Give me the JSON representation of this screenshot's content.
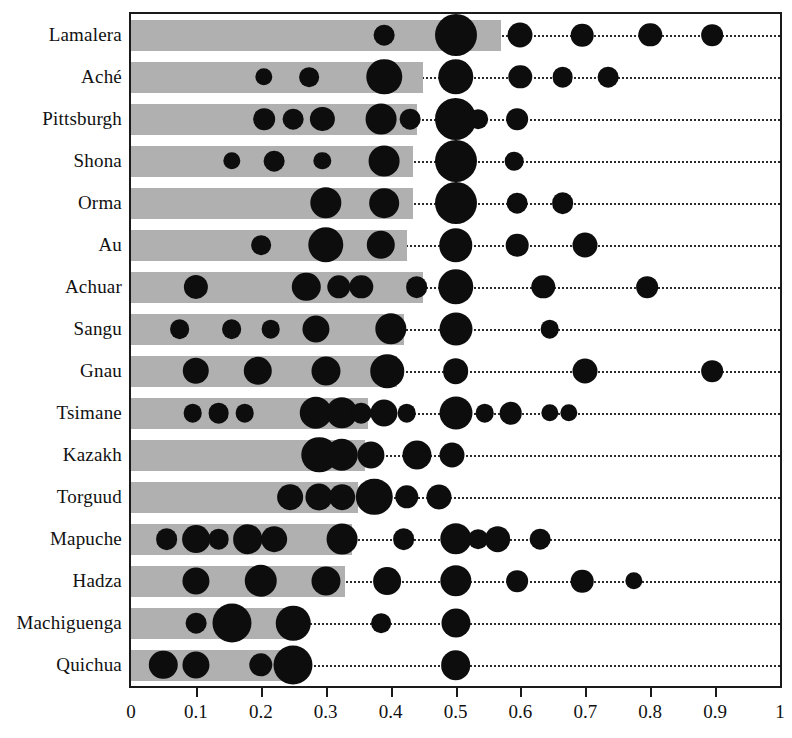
{
  "chart_data": {
    "type": "bar",
    "title": "",
    "xlabel": "",
    "ylabel": "",
    "xlim": [
      0,
      1
    ],
    "ylim": null,
    "grid": false,
    "legend": null,
    "xticks": [
      "0",
      "0.1",
      "0.2",
      "0.3",
      "0.4",
      "0.5",
      "0.6",
      "0.7",
      "0.8",
      "0.9",
      "1"
    ],
    "xtick_values": [
      0,
      0.1,
      0.2,
      0.3,
      0.4,
      0.5,
      0.6,
      0.7,
      0.8,
      0.9,
      1.0
    ],
    "categories": [
      "Lamalera",
      "Aché",
      "Pittsburgh",
      "Shona",
      "Orma",
      "Au",
      "Achuar",
      "Sangu",
      "Gnau",
      "Tsimane",
      "Kazakh",
      "Torguud",
      "Mapuche",
      "Hadza",
      "Machiguenga",
      "Quichua"
    ],
    "values": [
      0.57,
      0.45,
      0.44,
      0.435,
      0.435,
      0.425,
      0.45,
      0.42,
      0.41,
      0.365,
      0.36,
      0.35,
      0.34,
      0.33,
      0.26,
      0.25
    ],
    "series": [
      {
        "name": "Lamalera",
        "mean": 0.57,
        "mode_points": [
          {
            "x": 0.39,
            "weight": 0.07
          },
          {
            "x": 0.5,
            "weight": 0.63
          },
          {
            "x": 0.6,
            "weight": 0.12
          },
          {
            "x": 0.695,
            "weight": 0.09
          },
          {
            "x": 0.8,
            "weight": 0.1
          },
          {
            "x": 0.895,
            "weight": 0.08
          }
        ]
      },
      {
        "name": "Aché",
        "mean": 0.45,
        "mode_points": [
          {
            "x": 0.205,
            "weight": 0.04
          },
          {
            "x": 0.275,
            "weight": 0.06
          },
          {
            "x": 0.39,
            "weight": 0.3
          },
          {
            "x": 0.5,
            "weight": 0.3
          },
          {
            "x": 0.6,
            "weight": 0.1
          },
          {
            "x": 0.665,
            "weight": 0.07
          },
          {
            "x": 0.735,
            "weight": 0.07
          }
        ]
      },
      {
        "name": "Pittsburgh",
        "mean": 0.44,
        "mode_points": [
          {
            "x": 0.205,
            "weight": 0.08
          },
          {
            "x": 0.25,
            "weight": 0.07
          },
          {
            "x": 0.295,
            "weight": 0.11
          },
          {
            "x": 0.385,
            "weight": 0.21
          },
          {
            "x": 0.43,
            "weight": 0.07
          },
          {
            "x": 0.5,
            "weight": 0.45
          },
          {
            "x": 0.535,
            "weight": 0.06
          },
          {
            "x": 0.595,
            "weight": 0.08
          }
        ]
      },
      {
        "name": "Shona",
        "mean": 0.435,
        "mode_points": [
          {
            "x": 0.155,
            "weight": 0.04
          },
          {
            "x": 0.22,
            "weight": 0.07
          },
          {
            "x": 0.295,
            "weight": 0.04
          },
          {
            "x": 0.39,
            "weight": 0.21
          },
          {
            "x": 0.5,
            "weight": 0.48
          },
          {
            "x": 0.59,
            "weight": 0.05
          }
        ]
      },
      {
        "name": "Orma",
        "mean": 0.435,
        "mode_points": [
          {
            "x": 0.3,
            "weight": 0.22
          },
          {
            "x": 0.39,
            "weight": 0.19
          },
          {
            "x": 0.5,
            "weight": 0.48
          },
          {
            "x": 0.595,
            "weight": 0.07
          },
          {
            "x": 0.665,
            "weight": 0.08
          }
        ]
      },
      {
        "name": "Au",
        "mean": 0.425,
        "mode_points": [
          {
            "x": 0.2,
            "weight": 0.06
          },
          {
            "x": 0.3,
            "weight": 0.3
          },
          {
            "x": 0.385,
            "weight": 0.17
          },
          {
            "x": 0.5,
            "weight": 0.26
          },
          {
            "x": 0.595,
            "weight": 0.09
          },
          {
            "x": 0.7,
            "weight": 0.12
          }
        ]
      },
      {
        "name": "Achuar",
        "mean": 0.45,
        "mode_points": [
          {
            "x": 0.1,
            "weight": 0.11
          },
          {
            "x": 0.27,
            "weight": 0.17
          },
          {
            "x": 0.32,
            "weight": 0.1
          },
          {
            "x": 0.355,
            "weight": 0.1
          },
          {
            "x": 0.44,
            "weight": 0.08
          },
          {
            "x": 0.5,
            "weight": 0.3
          },
          {
            "x": 0.635,
            "weight": 0.1
          },
          {
            "x": 0.795,
            "weight": 0.08
          }
        ]
      },
      {
        "name": "Sangu",
        "mean": 0.42,
        "mode_points": [
          {
            "x": 0.075,
            "weight": 0.06
          },
          {
            "x": 0.155,
            "weight": 0.06
          },
          {
            "x": 0.215,
            "weight": 0.05
          },
          {
            "x": 0.285,
            "weight": 0.15
          },
          {
            "x": 0.4,
            "weight": 0.22
          },
          {
            "x": 0.5,
            "weight": 0.25
          },
          {
            "x": 0.645,
            "weight": 0.05
          }
        ]
      },
      {
        "name": "Gnau",
        "mean": 0.41,
        "mode_points": [
          {
            "x": 0.1,
            "weight": 0.14
          },
          {
            "x": 0.195,
            "weight": 0.17
          },
          {
            "x": 0.3,
            "weight": 0.18
          },
          {
            "x": 0.395,
            "weight": 0.26
          },
          {
            "x": 0.5,
            "weight": 0.13
          },
          {
            "x": 0.7,
            "weight": 0.12
          },
          {
            "x": 0.895,
            "weight": 0.08
          }
        ]
      },
      {
        "name": "Tsimane",
        "mean": 0.365,
        "mode_points": [
          {
            "x": 0.095,
            "weight": 0.05
          },
          {
            "x": 0.135,
            "weight": 0.07
          },
          {
            "x": 0.175,
            "weight": 0.05
          },
          {
            "x": 0.285,
            "weight": 0.24
          },
          {
            "x": 0.325,
            "weight": 0.22
          },
          {
            "x": 0.355,
            "weight": 0.07
          },
          {
            "x": 0.39,
            "weight": 0.15
          },
          {
            "x": 0.425,
            "weight": 0.05
          },
          {
            "x": 0.5,
            "weight": 0.25
          },
          {
            "x": 0.545,
            "weight": 0.05
          },
          {
            "x": 0.585,
            "weight": 0.09
          },
          {
            "x": 0.645,
            "weight": 0.04
          },
          {
            "x": 0.675,
            "weight": 0.04
          }
        ]
      },
      {
        "name": "Kazakh",
        "mean": 0.36,
        "mode_points": [
          {
            "x": 0.29,
            "weight": 0.3
          },
          {
            "x": 0.325,
            "weight": 0.24
          },
          {
            "x": 0.37,
            "weight": 0.15
          },
          {
            "x": 0.44,
            "weight": 0.18
          },
          {
            "x": 0.495,
            "weight": 0.12
          }
        ]
      },
      {
        "name": "Torguud",
        "mean": 0.35,
        "mode_points": [
          {
            "x": 0.245,
            "weight": 0.13
          },
          {
            "x": 0.29,
            "weight": 0.15
          },
          {
            "x": 0.325,
            "weight": 0.13
          },
          {
            "x": 0.375,
            "weight": 0.32
          },
          {
            "x": 0.425,
            "weight": 0.1
          },
          {
            "x": 0.475,
            "weight": 0.12
          }
        ]
      },
      {
        "name": "Mapuche",
        "mean": 0.34,
        "mode_points": [
          {
            "x": 0.055,
            "weight": 0.08
          },
          {
            "x": 0.1,
            "weight": 0.16
          },
          {
            "x": 0.135,
            "weight": 0.07
          },
          {
            "x": 0.18,
            "weight": 0.19
          },
          {
            "x": 0.22,
            "weight": 0.13
          },
          {
            "x": 0.325,
            "weight": 0.21
          },
          {
            "x": 0.42,
            "weight": 0.08
          },
          {
            "x": 0.5,
            "weight": 0.22
          },
          {
            "x": 0.535,
            "weight": 0.06
          },
          {
            "x": 0.565,
            "weight": 0.13
          },
          {
            "x": 0.63,
            "weight": 0.07
          }
        ]
      },
      {
        "name": "Hadza",
        "mean": 0.33,
        "mode_points": [
          {
            "x": 0.1,
            "weight": 0.15
          },
          {
            "x": 0.2,
            "weight": 0.24
          },
          {
            "x": 0.3,
            "weight": 0.18
          },
          {
            "x": 0.395,
            "weight": 0.16
          },
          {
            "x": 0.5,
            "weight": 0.22
          },
          {
            "x": 0.595,
            "weight": 0.08
          },
          {
            "x": 0.695,
            "weight": 0.09
          },
          {
            "x": 0.775,
            "weight": 0.04
          }
        ]
      },
      {
        "name": "Machiguenga",
        "mean": 0.26,
        "mode_points": [
          {
            "x": 0.1,
            "weight": 0.07
          },
          {
            "x": 0.155,
            "weight": 0.38
          },
          {
            "x": 0.25,
            "weight": 0.28
          },
          {
            "x": 0.385,
            "weight": 0.06
          },
          {
            "x": 0.5,
            "weight": 0.18
          }
        ]
      },
      {
        "name": "Quichua",
        "mean": 0.25,
        "mode_points": [
          {
            "x": 0.05,
            "weight": 0.17
          },
          {
            "x": 0.1,
            "weight": 0.15
          },
          {
            "x": 0.2,
            "weight": 0.1
          },
          {
            "x": 0.25,
            "weight": 0.38
          },
          {
            "x": 0.5,
            "weight": 0.19
          }
        ]
      }
    ]
  }
}
